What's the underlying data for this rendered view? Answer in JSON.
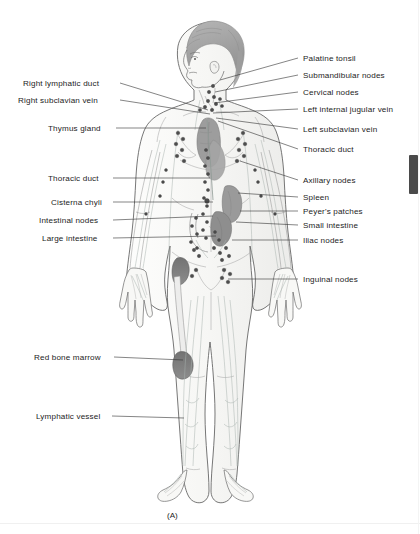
{
  "figure": {
    "caption": "(A)",
    "title_alt": "Lymphatic system of the human body",
    "colors": {
      "outline": "#595959",
      "vessel": "#a9b2ae",
      "node_fill": "#4d4d4d",
      "organ_gray": "#9a9a9a",
      "organ_dark": "#7d7d7d",
      "marrow": "#6e6e6e",
      "hair": "#a8a8a8",
      "skin": "#f7f7f5",
      "leader_line": "#333333",
      "text": "#1c1c1c",
      "scrollbar_thumb": "#4a4a4a",
      "background": "#ffffff"
    }
  },
  "labels_left": [
    {
      "id": "right-lymphatic-duct",
      "text": "Right lymphatic duct",
      "x": 23,
      "y": 79,
      "lx": 120,
      "ly": 83,
      "tx": 208,
      "ty": 110
    },
    {
      "id": "right-subclavian-vein",
      "text": "Right subclavian vein",
      "x": 18,
      "y": 96,
      "lx": 120,
      "ly": 100,
      "tx": 210,
      "ty": 114
    },
    {
      "id": "thymus-gland",
      "text": "Thymus gland",
      "x": 48,
      "y": 124,
      "lx": 116,
      "ly": 128,
      "tx": 206,
      "ty": 128
    },
    {
      "id": "thoracic-duct-left",
      "text": "Thoracic duct",
      "x": 48,
      "y": 174,
      "lx": 113,
      "ly": 178,
      "tx": 210,
      "ty": 178
    },
    {
      "id": "cisterna-chyli",
      "text": "Cisterna chyli",
      "x": 51,
      "y": 198,
      "lx": 113,
      "ly": 202,
      "tx": 213,
      "ty": 202
    },
    {
      "id": "intestinal-nodes",
      "text": "Intestinal nodes",
      "x": 39,
      "y": 216,
      "lx": 113,
      "ly": 220,
      "tx": 213,
      "ty": 216
    },
    {
      "id": "large-intestine",
      "text": "Large intestine",
      "x": 42,
      "y": 234,
      "lx": 113,
      "ly": 238,
      "tx": 216,
      "ty": 236
    },
    {
      "id": "red-bone-marrow",
      "text": "Red bone marrow",
      "x": 34,
      "y": 353,
      "lx": 114,
      "ly": 357,
      "tx": 183,
      "ty": 360
    },
    {
      "id": "lymphatic-vessel",
      "text": "Lymphatic vessel",
      "x": 36,
      "y": 412,
      "lx": 112,
      "ly": 416,
      "tx": 184,
      "ty": 418
    }
  ],
  "labels_right": [
    {
      "id": "palatine-tonsil",
      "text": "Palatine tonsil",
      "x": 303,
      "y": 54,
      "lx": 298,
      "ly": 58,
      "tx": 220,
      "ty": 80
    },
    {
      "id": "submandibular-nodes",
      "text": "Submandibular nodes",
      "x": 303,
      "y": 71,
      "lx": 298,
      "ly": 75,
      "tx": 215,
      "ty": 92
    },
    {
      "id": "cervical-nodes",
      "text": "Cervical nodes",
      "x": 303,
      "y": 88,
      "lx": 298,
      "ly": 92,
      "tx": 214,
      "ty": 103
    },
    {
      "id": "left-internal-jugular-vein",
      "text": "Left internal jugular vein",
      "x": 303,
      "y": 105,
      "lx": 298,
      "ly": 109,
      "tx": 213,
      "ty": 113
    },
    {
      "id": "left-subclavian-vein",
      "text": "Left subclavian vein",
      "x": 303,
      "y": 125,
      "lx": 298,
      "ly": 129,
      "tx": 216,
      "ty": 118
    },
    {
      "id": "thoracic-duct-right",
      "text": "Thoracic duct",
      "x": 303,
      "y": 145,
      "lx": 298,
      "ly": 149,
      "tx": 218,
      "ty": 121
    },
    {
      "id": "axillary-nodes",
      "text": "Axillary nodes",
      "x": 303,
      "y": 176,
      "lx": 298,
      "ly": 180,
      "tx": 240,
      "ty": 161
    },
    {
      "id": "spleen",
      "text": "Spleen",
      "x": 303,
      "y": 193,
      "lx": 298,
      "ly": 197,
      "tx": 238,
      "ty": 193
    },
    {
      "id": "peyers-patches",
      "text": "Peyer's patches",
      "x": 303,
      "y": 207,
      "lx": 298,
      "ly": 211,
      "tx": 240,
      "ty": 211
    },
    {
      "id": "small-intestine",
      "text": "Small intestine",
      "x": 303,
      "y": 221,
      "lx": 298,
      "ly": 225,
      "tx": 236,
      "ty": 222
    },
    {
      "id": "iliac-nodes",
      "text": "Iliac nodes",
      "x": 303,
      "y": 236,
      "lx": 298,
      "ly": 240,
      "tx": 232,
      "ty": 240
    },
    {
      "id": "inguinal-nodes",
      "text": "Inguinal nodes",
      "x": 303,
      "y": 275,
      "lx": 298,
      "ly": 279,
      "tx": 228,
      "ty": 279
    }
  ]
}
